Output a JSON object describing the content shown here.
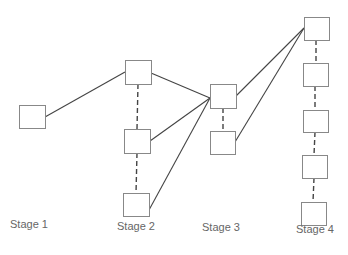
{
  "diagram": {
    "stages": [
      {
        "label": "Stage 1",
        "x": 10,
        "y": 228
      },
      {
        "label": "Stage 2",
        "x": 117,
        "y": 230
      },
      {
        "label": "Stage 3",
        "x": 202,
        "y": 231
      },
      {
        "label": "Stage 4",
        "x": 296,
        "y": 233
      }
    ],
    "nodes": [
      {
        "id": "s1a",
        "x": 19,
        "y": 105,
        "w": 26,
        "h": 23
      },
      {
        "id": "s2a",
        "x": 125,
        "y": 60,
        "w": 26,
        "h": 24
      },
      {
        "id": "s2b",
        "x": 124,
        "y": 129,
        "w": 26,
        "h": 24
      },
      {
        "id": "s2c",
        "x": 123,
        "y": 193,
        "w": 26,
        "h": 23
      },
      {
        "id": "s3a",
        "x": 210,
        "y": 84,
        "w": 26,
        "h": 24
      },
      {
        "id": "s3b",
        "x": 210,
        "y": 131,
        "w": 25,
        "h": 23
      },
      {
        "id": "s4a",
        "x": 304,
        "y": 17,
        "w": 25,
        "h": 23
      },
      {
        "id": "s4b",
        "x": 303,
        "y": 63,
        "w": 25,
        "h": 23
      },
      {
        "id": "s4c",
        "x": 303,
        "y": 110,
        "w": 25,
        "h": 22
      },
      {
        "id": "s4d",
        "x": 302,
        "y": 155,
        "w": 25,
        "h": 23
      },
      {
        "id": "s4e",
        "x": 301,
        "y": 202,
        "w": 25,
        "h": 23
      }
    ],
    "solid_edges": [
      [
        45,
        117,
        125,
        72
      ],
      [
        151,
        73,
        210,
        98
      ],
      [
        150,
        141,
        210,
        98
      ],
      [
        149,
        210,
        210,
        98
      ],
      [
        236,
        96,
        304,
        28
      ],
      [
        235,
        142,
        304,
        28
      ]
    ],
    "dashed_edges": [
      [
        138,
        84,
        137,
        129
      ],
      [
        137,
        153,
        136,
        193
      ],
      [
        223,
        108,
        223,
        131
      ],
      [
        316,
        40,
        316,
        63
      ],
      [
        315,
        86,
        315,
        110
      ],
      [
        315,
        132,
        314,
        155
      ],
      [
        314,
        178,
        313,
        202
      ]
    ],
    "colors": {
      "stroke": "#444444",
      "box": "#888888",
      "text": "#666666"
    }
  }
}
